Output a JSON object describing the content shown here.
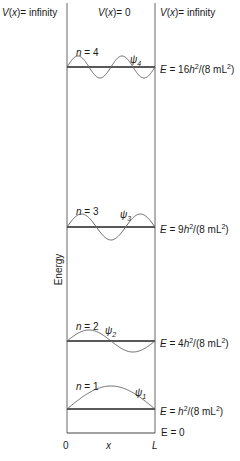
{
  "header": {
    "left_potential": {
      "fn": "V",
      "var": "x",
      "value": "= infinity"
    },
    "center_potential": {
      "fn": "V",
      "var": "x",
      "value": "= 0"
    },
    "right_potential": {
      "fn": "V",
      "var": "x",
      "value": "= infinity"
    }
  },
  "axis": {
    "ylabel": "Energy",
    "x_start": "0",
    "x_label": "x",
    "x_end": "L",
    "ground": "E = 0"
  },
  "levels": [
    {
      "n_label": "n = 4",
      "psi": "ψ",
      "psi_sub": "4",
      "energy_prefix": "E = 16h",
      "energy_sup": "2",
      "energy_suffix": "/(8 mL",
      "energy_sup2": "2",
      "energy_close": ")",
      "y": 67,
      "amp": 11,
      "n": 4
    },
    {
      "n_label": "n = 3",
      "psi": "ψ",
      "psi_sub": "3",
      "energy_prefix": "E = 9h",
      "energy_sup": "2",
      "energy_suffix": "/(8 mL",
      "energy_sup2": "2",
      "energy_close": ")",
      "y": 227,
      "amp": 13,
      "n": 3
    },
    {
      "n_label": "n = 2",
      "psi": "ψ",
      "psi_sub": "2",
      "energy_prefix": "E = 4h",
      "energy_sup": "2",
      "energy_suffix": "/(8 mL",
      "energy_sup2": "2",
      "energy_close": ")",
      "y": 341,
      "amp": 11,
      "n": 2
    },
    {
      "n_label": "n = 1",
      "psi": "ψ",
      "psi_sub": "1",
      "energy_prefix": "E = h",
      "energy_sup": "2",
      "energy_suffix": "/(8 mL",
      "energy_sup2": "2",
      "energy_close": ")",
      "y": 409,
      "amp": 23,
      "n": 1
    }
  ],
  "colors": {
    "wall": "#555555",
    "level": "#222222",
    "wave": "#666666"
  }
}
